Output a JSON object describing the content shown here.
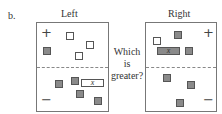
{
  "panel_label": "b.",
  "left": {
    "title": "Left",
    "plus": "+",
    "minus": "−",
    "unknown_label": "x"
  },
  "right": {
    "title": "Right",
    "plus": "+",
    "minus": "−",
    "unknown_label": "x"
  },
  "question": {
    "line1": "Which",
    "line2": "is",
    "line3": "greater?"
  }
}
